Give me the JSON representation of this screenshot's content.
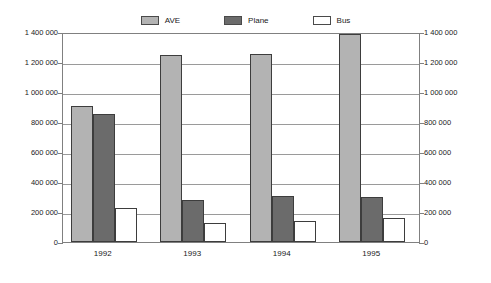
{
  "chart_data": {
    "type": "bar",
    "title": "",
    "subtitle": "",
    "xlabel": "",
    "ylabel": "",
    "categories": [
      "1992",
      "1993",
      "1994",
      "1995"
    ],
    "series": [
      {
        "name": "AVE",
        "color": "#b3b3b3",
        "values": [
          910000,
          1250000,
          1255000,
          1390000
        ]
      },
      {
        "name": "Plane",
        "color": "#6b6b6b",
        "values": [
          855000,
          280000,
          305000,
          300000
        ]
      },
      {
        "name": "Bus",
        "color": "#ffffff",
        "values": [
          230000,
          125000,
          140000,
          160000
        ]
      }
    ],
    "ylim": [
      0,
      1400000
    ],
    "ytick_values": [
      0,
      200000,
      400000,
      600000,
      800000,
      1000000,
      1200000,
      1400000
    ],
    "ytick_labels_left": [
      "0",
      "200 000",
      "400 000",
      "600 000",
      "800 000",
      "1 000 000",
      "1 200 000",
      "1 400 000"
    ],
    "ytick_labels_right": [
      "0",
      "200 000",
      "400 000",
      "600 000",
      "800 000",
      "1 000 000",
      "1 200 000",
      "1 400 000"
    ],
    "dual_axis": true,
    "grid": true,
    "grid_axis": "y",
    "legend_position": "top-center",
    "legend_entries": [
      "AVE",
      "Plane",
      "Bus"
    ],
    "bar_border_color": "#3d3d3d",
    "plot_border_color": "#808080",
    "gridline_color": "#9a9a9a",
    "background_color": "#ffffff"
  }
}
